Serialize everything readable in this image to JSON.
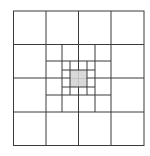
{
  "diagram": {
    "colors": {
      "background": "#ffffff",
      "line": "#3a3a3a",
      "center_fill": "#d9d9d9",
      "center_inner_line": "#bdbdbd"
    },
    "outer_bounds": {
      "x0": 13.5,
      "y0": 11,
      "x1": 144,
      "y1": 145.5
    },
    "level1": {
      "x": [
        13.5,
        46,
        78.5,
        111,
        144
      ],
      "y": [
        11,
        44.5,
        78,
        112,
        145.5
      ]
    },
    "level2": {
      "x": [
        62,
        95
      ],
      "y": [
        61,
        95
      ],
      "span_x": [
        46,
        111
      ],
      "span_y": [
        44.5,
        112
      ]
    },
    "level3": {
      "x": [
        70,
        87
      ],
      "y": [
        70,
        87
      ],
      "span_x": [
        62,
        95
      ],
      "span_y": [
        61,
        95
      ]
    },
    "shaded_cell": {
      "x0": 70,
      "y0": 70,
      "x1": 87,
      "y1": 87
    }
  }
}
